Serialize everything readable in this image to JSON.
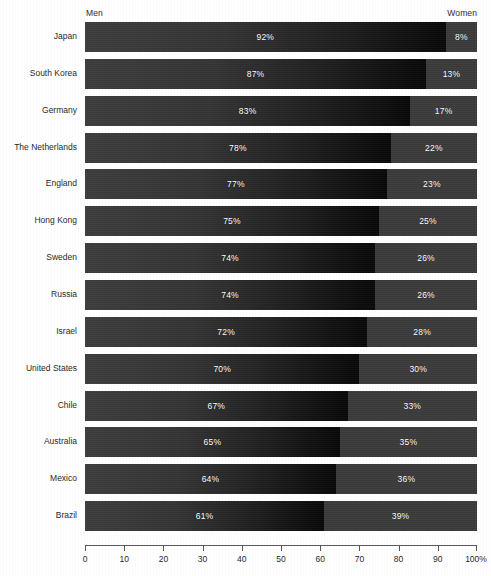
{
  "legend": {
    "left_label": "Men",
    "right_label": "Women"
  },
  "axis": {
    "ticks": [
      "0",
      "10",
      "20",
      "30",
      "40",
      "50",
      "60",
      "70",
      "80",
      "90",
      "100%"
    ],
    "tick_values": [
      0,
      10,
      20,
      30,
      40,
      50,
      60,
      70,
      80,
      90,
      100
    ],
    "min": 0,
    "max": 100
  },
  "colors": {
    "men_start": "#3c3c3c",
    "men_end": "#080808",
    "women": "#3a3a3a",
    "value_text": "#ffffff",
    "label_text": "#1f1f1f",
    "axis": "#555555",
    "background": "#ffffff"
  },
  "chart_data": {
    "type": "bar",
    "title": "",
    "subtitle": "",
    "xlabel": "",
    "ylabel": "",
    "orientation": "horizontal",
    "stacked": true,
    "stack_total": 100,
    "grid": false,
    "legend_position": "top",
    "xlim": [
      0,
      100
    ],
    "xtick_labels": [
      "0",
      "10",
      "20",
      "30",
      "40",
      "50",
      "60",
      "70",
      "80",
      "90",
      "100%"
    ],
    "categories": [
      "Japan",
      "South Korea",
      "Germany",
      "The Netherlands",
      "England",
      "Hong Kong",
      "Sweden",
      "Russia",
      "Israel",
      "United States",
      "Chile",
      "Australia",
      "Mexico",
      "Brazil"
    ],
    "series": [
      {
        "name": "Men",
        "values": [
          92,
          87,
          83,
          78,
          77,
          75,
          74,
          74,
          72,
          70,
          67,
          65,
          64,
          61
        ],
        "labels": [
          "92%",
          "87%",
          "83%",
          "78%",
          "77%",
          "75%",
          "74%",
          "74%",
          "72%",
          "70%",
          "67%",
          "65%",
          "64%",
          "61%"
        ]
      },
      {
        "name": "Women",
        "values": [
          8,
          13,
          17,
          22,
          23,
          25,
          26,
          26,
          28,
          30,
          33,
          35,
          36,
          39
        ],
        "labels": [
          "8%",
          "13%",
          "17%",
          "22%",
          "23%",
          "25%",
          "26%",
          "26%",
          "28%",
          "30%",
          "33%",
          "35%",
          "36%",
          "39%"
        ]
      }
    ]
  }
}
